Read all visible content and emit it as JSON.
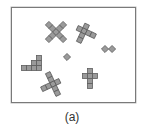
{
  "figure": {
    "caption": "(a)",
    "tile_fill": "#9a9a9a",
    "tile_stroke": "#5e5e5e",
    "frame_color": "#7a7a7a"
  },
  "shapes": [
    {
      "name": "x-cross",
      "cx": 56,
      "cy": 32,
      "rotate": 45,
      "cells": [
        [
          0,
          0
        ],
        [
          1,
          0
        ],
        [
          2,
          0
        ],
        [
          -1,
          0
        ],
        [
          -2,
          0
        ],
        [
          0,
          1
        ],
        [
          0,
          2
        ],
        [
          0,
          -1
        ],
        [
          0,
          -2
        ]
      ]
    },
    {
      "name": "tilted-cross-top-right",
      "cx": 84,
      "cy": 31,
      "rotate": 25,
      "cells": [
        [
          0,
          0
        ],
        [
          -1,
          0
        ],
        [
          1,
          0
        ],
        [
          2,
          0
        ],
        [
          0,
          -1
        ],
        [
          0,
          1
        ],
        [
          0,
          2
        ]
      ]
    },
    {
      "name": "staircase",
      "cx": 34,
      "cy": 63,
      "rotate": 0,
      "cells": [
        [
          -1,
          1
        ],
        [
          0,
          1
        ],
        [
          1,
          1
        ],
        [
          0,
          0
        ],
        [
          1,
          0
        ],
        [
          1,
          -1
        ],
        [
          -2,
          1
        ]
      ]
    },
    {
      "name": "single-diamond",
      "cx": 67,
      "cy": 57,
      "rotate": 45,
      "cells": [
        [
          0,
          0
        ]
      ]
    },
    {
      "name": "double-diamond",
      "cx": 105,
      "cy": 49,
      "rotate": 45,
      "cells": [
        [
          0,
          0
        ],
        [
          1,
          -1
        ]
      ]
    },
    {
      "name": "tilted-cross-bottom-left",
      "cx": 53,
      "cy": 84,
      "rotate": -25,
      "cells": [
        [
          0,
          0
        ],
        [
          -1,
          0
        ],
        [
          -2,
          0
        ],
        [
          1,
          0
        ],
        [
          0,
          -1
        ],
        [
          0,
          -2
        ],
        [
          0,
          1
        ],
        [
          0,
          2
        ]
      ]
    },
    {
      "name": "upright-cross",
      "cx": 90,
      "cy": 81,
      "rotate": 0,
      "cells": [
        [
          0,
          -2
        ],
        [
          0,
          -1
        ],
        [
          0,
          0
        ],
        [
          0,
          1
        ],
        [
          -1,
          -1
        ],
        [
          1,
          -1
        ]
      ]
    }
  ]
}
